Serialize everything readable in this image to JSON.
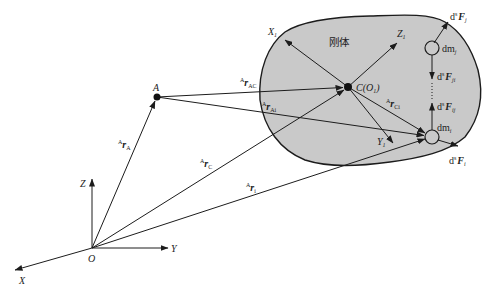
{
  "diagram": {
    "body_label": "刚体",
    "colors": {
      "body_fill": "#c9c9c9",
      "stroke": "#1c1c1c",
      "background": "#ffffff"
    },
    "global_frame": {
      "origin": "O",
      "x_axis": "X",
      "y_axis": "Y",
      "z_axis": "Z"
    },
    "point_a": "A",
    "body_frame": {
      "center_base": "C(O",
      "center_sub": "1",
      "center_close": ")",
      "x_axis": "X",
      "x_sub": "1",
      "y_axis": "Y",
      "y_sub": "1",
      "z_axis": "Z",
      "z_sub": "1"
    },
    "vectors": {
      "r_A": {
        "sup": "A",
        "base": "r",
        "sub": "A"
      },
      "r_AC": {
        "sup": "A",
        "base": "r",
        "sub": "AC"
      },
      "r_Ai": {
        "sup": "A",
        "base": "r",
        "sub": "Ai"
      },
      "r_C": {
        "sup": "A",
        "base": "r",
        "sub": "C"
      },
      "r_Ci": {
        "sup": "A",
        "base": "r",
        "sub": "Ci"
      },
      "r_i": {
        "sup": "A",
        "base": "r",
        "sub": "i"
      }
    },
    "masses": {
      "dm_j": {
        "base": "dm",
        "sub": "j"
      },
      "dm_i": {
        "base": "dm",
        "sub": "i"
      }
    },
    "forces": {
      "F_j": {
        "d": "d",
        "sup": "s",
        "base": "F",
        "sub": "j"
      },
      "F_ji": {
        "d": "d",
        "sup": "s",
        "base": "F",
        "sub": "ji"
      },
      "F_ij": {
        "d": "d",
        "sup": "s",
        "base": "F",
        "sub": "ij"
      },
      "F_i": {
        "d": "d",
        "sup": "s",
        "base": "F",
        "sub": "i"
      }
    }
  }
}
